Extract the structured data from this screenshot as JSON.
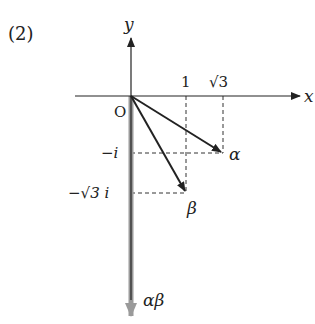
{
  "problem_label": "(2)",
  "axes": {
    "x_label": "x",
    "y_label": "y",
    "origin_label": "O"
  },
  "ticks": {
    "x": [
      {
        "label": "1",
        "value": 1
      },
      {
        "label": "√3",
        "value": 1.732
      }
    ],
    "y": [
      {
        "label": "−i",
        "value": -1
      },
      {
        "label": "−√3 i",
        "value": -1.732
      }
    ]
  },
  "vectors": [
    {
      "name": "alpha",
      "label": "α",
      "re": 1.732,
      "im": -1,
      "color": "#222222"
    },
    {
      "name": "beta",
      "label": "β",
      "re": 1,
      "im": -1.732,
      "color": "#222222"
    },
    {
      "name": "alpha-beta",
      "label": "αβ",
      "re": 0,
      "im": -4,
      "color": "#999999"
    }
  ],
  "bottom_partial_label": "−4i",
  "colors": {
    "axis": "#222222",
    "product_vector": "#9a9a9a",
    "dashed": "#333333"
  }
}
